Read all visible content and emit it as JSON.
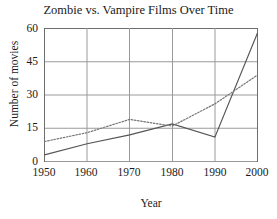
{
  "chart_data": {
    "type": "line",
    "title": "Zombie vs. Vampire Films Over Time",
    "xlabel": "Year",
    "ylabel": "Number of movies",
    "x": [
      1950,
      1960,
      1970,
      1980,
      1990,
      2000
    ],
    "xtick_labels": [
      "1950",
      "1960",
      "1970",
      "1980",
      "1990",
      "2000"
    ],
    "ytick_labels": [
      "0",
      "15",
      "30",
      "45",
      "60"
    ],
    "yticks": [
      0,
      15,
      30,
      45,
      60
    ],
    "ylim": [
      0,
      60
    ],
    "xlim": [
      1950,
      2000
    ],
    "grid": true,
    "legend": "none",
    "series": [
      {
        "name": "Zombie films",
        "style": "solid",
        "color": "#555555",
        "values": [
          3,
          8,
          12,
          17,
          11,
          58
        ]
      },
      {
        "name": "Vampire films",
        "style": "dotted",
        "color": "#777777",
        "values": [
          9,
          13,
          19,
          16,
          26,
          39
        ]
      }
    ]
  },
  "figure": {
    "background": "#ffffff",
    "axis_color": "#808080",
    "text_color": "#1a1a1a"
  }
}
